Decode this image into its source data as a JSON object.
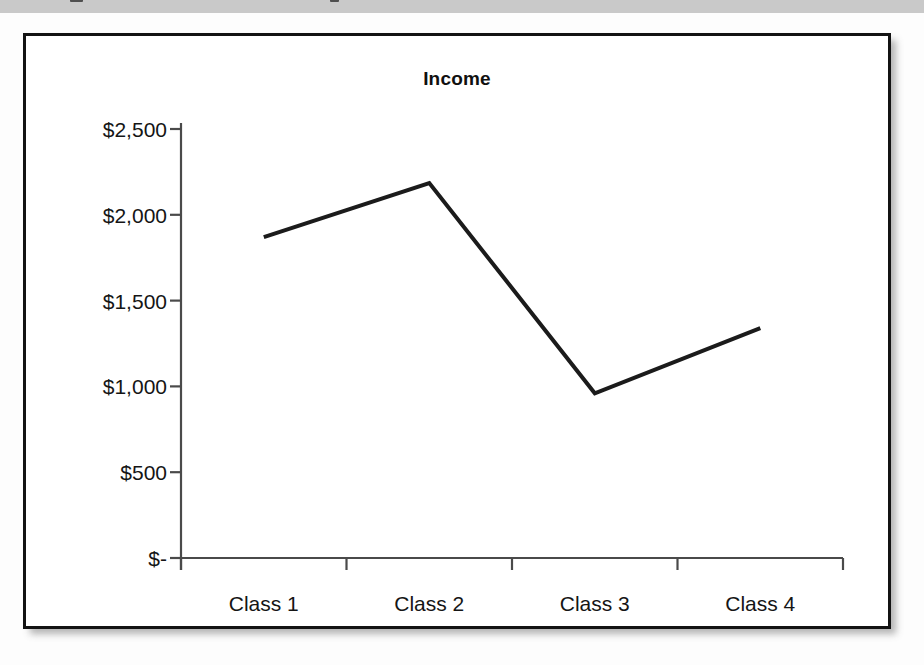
{
  "page": {
    "top_band": {
      "present": true,
      "color": "#c9c9c9",
      "note": ""
    },
    "frame": {
      "border_color": "#131313",
      "background": "#ffffff"
    }
  },
  "chart_data": {
    "type": "line",
    "title": "Income",
    "xlabel": "",
    "ylabel": "",
    "categories": [
      "Class 1",
      "Class 2",
      "Class 3",
      "Class 4"
    ],
    "values": [
      1870,
      2185,
      960,
      1340
    ],
    "series": [
      {
        "name": "Income",
        "values": [
          1870,
          2185,
          960,
          1340
        ],
        "color": "#1b1b1b",
        "line_width": 4,
        "markers": false
      }
    ],
    "ylim": [
      0,
      2500
    ],
    "ytick_values": [
      0,
      500,
      1000,
      1500,
      2000,
      2500
    ],
    "ytick_labels": [
      "$-",
      "$500",
      "$1,000",
      "$1,500",
      "$2,000",
      "$2,500"
    ],
    "xtick_labels": [
      "Class 1",
      "Class 2",
      "Class 3",
      "Class 4"
    ],
    "grid": false,
    "legend": false,
    "legend_position": "none",
    "axis_color": "#4a4a4a",
    "currency_prefix": "$"
  }
}
